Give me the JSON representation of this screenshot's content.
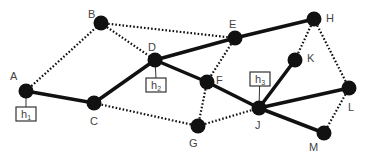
{
  "diagram": {
    "type": "network-graph",
    "nodes": [
      {
        "id": "A",
        "label": "A",
        "x": 26,
        "y": 91,
        "lx": 10,
        "ly": 80
      },
      {
        "id": "B",
        "label": "B",
        "x": 101,
        "y": 23,
        "lx": 88,
        "ly": 18
      },
      {
        "id": "C",
        "label": "C",
        "x": 94,
        "y": 103,
        "lx": 90,
        "ly": 125
      },
      {
        "id": "D",
        "label": "D",
        "x": 155,
        "y": 60,
        "lx": 148,
        "ly": 51
      },
      {
        "id": "E",
        "label": "E",
        "x": 235,
        "y": 38,
        "lx": 229,
        "ly": 28
      },
      {
        "id": "F",
        "label": "F",
        "x": 207,
        "y": 82,
        "lx": 216,
        "ly": 84
      },
      {
        "id": "G",
        "label": "G",
        "x": 198,
        "y": 126,
        "lx": 189,
        "ly": 147
      },
      {
        "id": "H",
        "label": "H",
        "x": 314,
        "y": 19,
        "lx": 326,
        "ly": 22
      },
      {
        "id": "J",
        "label": "J",
        "x": 259,
        "y": 108,
        "lx": 255,
        "ly": 129
      },
      {
        "id": "K",
        "label": "K",
        "x": 295,
        "y": 60,
        "lx": 307,
        "ly": 62
      },
      {
        "id": "L",
        "label": "L",
        "x": 349,
        "y": 88,
        "lx": 348,
        "ly": 111
      },
      {
        "id": "M",
        "label": "M",
        "x": 324,
        "y": 133,
        "lx": 309,
        "ly": 151
      }
    ],
    "solid_edges": [
      [
        "A",
        "C"
      ],
      [
        "C",
        "D"
      ],
      [
        "D",
        "E"
      ],
      [
        "E",
        "H"
      ],
      [
        "D",
        "F"
      ],
      [
        "F",
        "J"
      ],
      [
        "J",
        "K"
      ],
      [
        "J",
        "L"
      ],
      [
        "J",
        "M"
      ]
    ],
    "dotted_edges": [
      [
        "A",
        "B"
      ],
      [
        "B",
        "D"
      ],
      [
        "B",
        "E"
      ],
      [
        "E",
        "F"
      ],
      [
        "F",
        "G"
      ],
      [
        "G",
        "C"
      ],
      [
        "G",
        "J"
      ],
      [
        "H",
        "K"
      ],
      [
        "H",
        "L"
      ],
      [
        "L",
        "M"
      ]
    ],
    "hosts": [
      {
        "id": "h1",
        "label": "h",
        "sub": "1",
        "attached_to": "A",
        "x": 16,
        "y": 107,
        "w": 20,
        "h": 14
      },
      {
        "id": "h2",
        "label": "h",
        "sub": "2",
        "attached_to": "D",
        "x": 146,
        "y": 78,
        "w": 20,
        "h": 14
      },
      {
        "id": "h3",
        "label": "h",
        "sub": "3",
        "attached_to": "J",
        "x": 250,
        "y": 72,
        "w": 20,
        "h": 14
      }
    ],
    "colors": {
      "node": "#111111",
      "edge": "#111111",
      "label": "#444444",
      "host_border": "#333333"
    }
  }
}
